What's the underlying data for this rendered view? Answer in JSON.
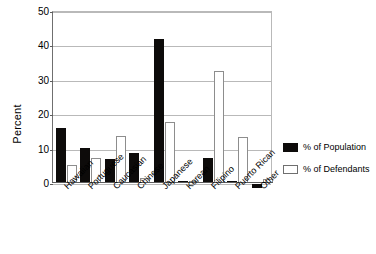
{
  "chart_data": {
    "type": "bar",
    "title": "",
    "subtitle": "",
    "xlabel": "",
    "ylabel": "Percent",
    "ylim": [
      0,
      50
    ],
    "yticks": [
      0,
      10,
      20,
      30,
      40,
      50
    ],
    "ytick_labels": [
      "0",
      "10",
      "20",
      "30",
      "40",
      "50"
    ],
    "grid": true,
    "legend_position": "right",
    "categories": [
      "Hawaiian",
      "Portuguese",
      "Caucasian",
      "Chinese",
      "Japanese",
      "Korean",
      "Filipino",
      "Puerto Rican",
      "Other"
    ],
    "series": [
      {
        "name": "% of Population",
        "color": "#0d0b0a",
        "style": "filled-black",
        "values": [
          16,
          10.2,
          7,
          8.7,
          42,
          0.7,
          7.2,
          0.7,
          -1.2
        ]
      },
      {
        "name": "% of Defendants",
        "color": "#ffffff",
        "style": "outlined-white",
        "values": [
          5.2,
          7.4,
          13.6,
          1.5,
          17.6,
          0.5,
          32.5,
          13.3,
          1.2
        ]
      }
    ]
  },
  "axis": {
    "y_title": "Percent"
  },
  "legend": {
    "items": [
      {
        "label": "% of Population"
      },
      {
        "label": "% of Defendants"
      }
    ]
  }
}
